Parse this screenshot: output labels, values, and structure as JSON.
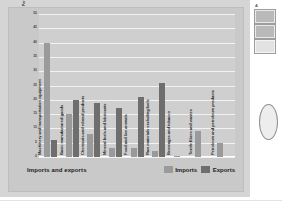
{
  "slide": {
    "footer_title": "Imports and exports"
  },
  "side_panel": {
    "header": "A",
    "thumbnails": [
      "thumbnail-1",
      "thumbnail-2",
      "thumbnail-3"
    ],
    "shape_name": "oval-shape"
  },
  "legend": {
    "items": [
      {
        "label": "Imports",
        "color": "#9a9a9a"
      },
      {
        "label": "Exports",
        "color": "#6e6e6e"
      }
    ]
  },
  "chart_data": {
    "type": "bar",
    "title": "Imports and exports",
    "xlabel": "",
    "ylabel": "Percentage of total",
    "ylim": [
      0,
      50
    ],
    "yticks": [
      50,
      45,
      40,
      35,
      30,
      25,
      20,
      15,
      10,
      5,
      0
    ],
    "grid": true,
    "legend_position": "bottom-right",
    "categories": [
      "Machinery and transportation equipment",
      "Basic manufactured goods",
      "Chemicals and related products",
      "Mineral fuels and lubricants",
      "Food and live animals",
      "Raw materials excluding fuels",
      "Beverages and tobacco",
      "Textile fibers and wastes",
      "Petroleum and petroleum products"
    ],
    "series": [
      {
        "name": "Imports",
        "color": "#9a9a9a",
        "values": [
          40,
          15,
          8,
          3,
          3,
          2,
          0.3,
          9,
          5
        ]
      },
      {
        "name": "Exports",
        "color": "#6e6e6e",
        "values": [
          6,
          20,
          19,
          17,
          21,
          26,
          0,
          0,
          0
        ]
      }
    ]
  }
}
